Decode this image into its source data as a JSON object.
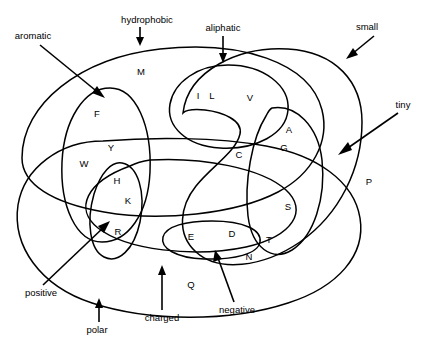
{
  "diagram": {
    "stroke_color": "#000000",
    "background_color": "#ffffff",
    "residues": [
      {
        "id": "residue-M",
        "label": "M",
        "x": 141,
        "y": 72
      },
      {
        "id": "residue-F",
        "label": "F",
        "x": 97,
        "y": 114
      },
      {
        "id": "residue-I",
        "label": "I",
        "x": 198,
        "y": 96
      },
      {
        "id": "residue-L",
        "label": "L",
        "x": 212,
        "y": 96
      },
      {
        "id": "residue-V",
        "label": "V",
        "x": 250,
        "y": 98
      },
      {
        "id": "residue-A",
        "label": "A",
        "x": 289,
        "y": 130
      },
      {
        "id": "residue-Y",
        "label": "Y",
        "x": 111,
        "y": 148
      },
      {
        "id": "residue-G",
        "label": "G",
        "x": 284,
        "y": 148
      },
      {
        "id": "residue-C",
        "label": "C",
        "x": 239,
        "y": 155
      },
      {
        "id": "residue-W",
        "label": "W",
        "x": 84,
        "y": 164
      },
      {
        "id": "residue-H",
        "label": "H",
        "x": 117,
        "y": 181
      },
      {
        "id": "residue-P",
        "label": "P",
        "x": 369,
        "y": 182
      },
      {
        "id": "residue-K",
        "label": "K",
        "x": 128,
        "y": 201
      },
      {
        "id": "residue-S",
        "label": "S",
        "x": 288,
        "y": 207
      },
      {
        "id": "residue-R",
        "label": "R",
        "x": 118,
        "y": 232
      },
      {
        "id": "residue-E",
        "label": "E",
        "x": 191,
        "y": 237
      },
      {
        "id": "residue-D",
        "label": "D",
        "x": 232,
        "y": 234
      },
      {
        "id": "residue-T",
        "label": "T",
        "x": 269,
        "y": 240
      },
      {
        "id": "residue-N",
        "label": "N",
        "x": 249,
        "y": 257
      },
      {
        "id": "residue-Q",
        "label": "Q",
        "x": 191,
        "y": 285
      }
    ],
    "groups": [
      {
        "id": "group-aromatic",
        "label": "aromatic",
        "x": 33,
        "y": 36
      },
      {
        "id": "group-hydrophobic",
        "label": "hydrophobic",
        "x": 147,
        "y": 20
      },
      {
        "id": "group-aliphatic",
        "label": "aliphatic",
        "x": 223,
        "y": 28
      },
      {
        "id": "group-small",
        "label": "small",
        "x": 367,
        "y": 27
      },
      {
        "id": "group-tiny",
        "label": "tiny",
        "x": 403,
        "y": 105
      },
      {
        "id": "group-positive",
        "label": "positive",
        "x": 41,
        "y": 293
      },
      {
        "id": "group-polar",
        "label": "polar",
        "x": 97,
        "y": 330
      },
      {
        "id": "group-charged",
        "label": "charged",
        "x": 162,
        "y": 318
      },
      {
        "id": "group-negative",
        "label": "negative",
        "x": 237,
        "y": 310
      }
    ],
    "group_members": {
      "hydrophobic": [
        "M",
        "F",
        "I",
        "L",
        "V",
        "A",
        "Y",
        "G",
        "C",
        "W",
        "H",
        "K",
        "T"
      ],
      "aromatic": [
        "F",
        "Y",
        "W",
        "H"
      ],
      "aliphatic": [
        "I",
        "L",
        "V"
      ],
      "small": [
        "A",
        "G",
        "C",
        "S",
        "T",
        "D",
        "N",
        "V",
        "P"
      ],
      "tiny": [
        "A",
        "G",
        "S",
        "C"
      ],
      "polar": [
        "Y",
        "W",
        "H",
        "K",
        "R",
        "E",
        "D",
        "Q",
        "N",
        "S",
        "T",
        "C"
      ],
      "charged": [
        "H",
        "K",
        "R",
        "E",
        "D"
      ],
      "positive": [
        "H",
        "K",
        "R"
      ],
      "negative": [
        "E",
        "D"
      ]
    }
  }
}
